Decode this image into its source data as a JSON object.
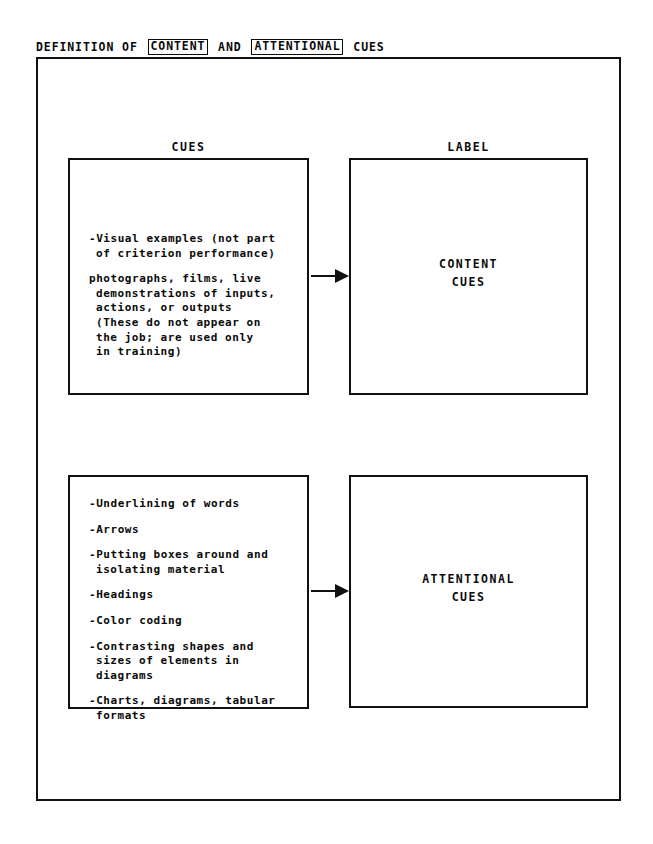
{
  "title": {
    "segments": [
      {
        "text": "DEFINITION OF ",
        "boxed": false
      },
      {
        "text": "CONTENT",
        "boxed": true
      },
      {
        "text": " AND ",
        "boxed": false
      },
      {
        "text": "ATTENTIONAL",
        "boxed": true
      },
      {
        "text": " CUES",
        "boxed": false
      }
    ],
    "part1": "DEFINITION OF ",
    "boxed1": "CONTENT",
    "part2": " AND ",
    "boxed2": "ATTENTIONAL",
    "part3": " CUES"
  },
  "columns": {
    "cues_header": "CUES",
    "label_header": "LABEL"
  },
  "rows": [
    {
      "id": "content",
      "label": "CONTENT\nCUES",
      "groups": [
        {
          "lines": [
            "-Visual examples (not part",
            "of criterion performance)"
          ]
        },
        {
          "lines": [
            "photographs, films, live",
            "demonstrations of inputs,",
            "actions, or outputs",
            "(These do not appear on",
            "the job; are used only",
            "in training)"
          ]
        }
      ]
    },
    {
      "id": "attentional",
      "label": "ATTENTIONAL\nCUES",
      "groups": [
        {
          "lines": [
            "-Underlining of words"
          ]
        },
        {
          "lines": [
            "-Arrows"
          ]
        },
        {
          "lines": [
            "-Putting boxes around and",
            "isolating material"
          ]
        },
        {
          "lines": [
            "-Headings"
          ]
        },
        {
          "lines": [
            "-Color coding"
          ]
        },
        {
          "lines": [
            "-Contrasting shapes and",
            "sizes of elements in",
            "diagrams"
          ]
        },
        {
          "lines": [
            "-Charts, diagrams, tabular",
            "formats"
          ]
        }
      ]
    }
  ],
  "arrows": {
    "content_arrow": "arrow-right",
    "attentional_arrow": "arrow-right"
  },
  "colors": {
    "ink": "#111111",
    "paper": "#ffffff"
  }
}
